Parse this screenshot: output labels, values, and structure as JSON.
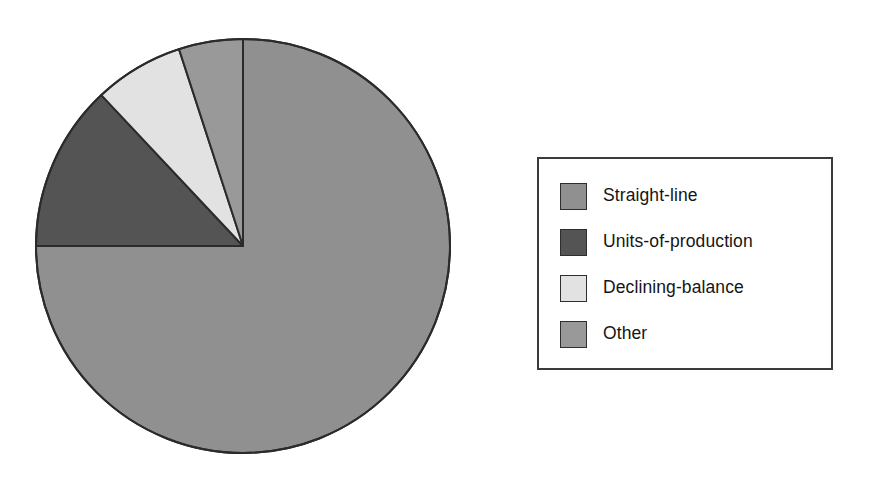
{
  "chart_data": {
    "type": "pie",
    "title": "",
    "subtitle": "",
    "xlabel": "",
    "ylabel": "",
    "grid": false,
    "legend_position": "right",
    "categories": [
      "Straight-line",
      "Units-of-production",
      "Declining-balance",
      "Other"
    ],
    "values": [
      75,
      13,
      7,
      5
    ],
    "unit": "%",
    "slice_order": "clockwise-from-top",
    "slices": [
      {
        "label": "Straight-line",
        "value": 75,
        "color": "#909090",
        "start_angle_deg": 0,
        "end_angle_deg": 270
      },
      {
        "label": "Units-of-production",
        "value": 13,
        "color": "#545454",
        "start_angle_deg": 270,
        "end_angle_deg": 316.8
      },
      {
        "label": "Declining-balance",
        "value": 7,
        "color": "#e2e2e2",
        "start_angle_deg": 316.8,
        "end_angle_deg": 342
      },
      {
        "label": "Other",
        "value": 5,
        "color": "#999999",
        "start_angle_deg": 342,
        "end_angle_deg": 360
      }
    ],
    "geometry": {
      "center_x": 243,
      "center_y": 246,
      "radius": 207
    },
    "style": {
      "outline_color": "#2b2b2b",
      "outline_width": 2,
      "background": "#ffffff"
    }
  },
  "legend": {
    "border_color": "#3b3b3b",
    "background": "#ffffff",
    "items": [
      {
        "label": "Straight-line",
        "color": "#909090"
      },
      {
        "label": "Units-of-production",
        "color": "#545454"
      },
      {
        "label": "Declining-balance",
        "color": "#e2e2e2"
      },
      {
        "label": "Other",
        "color": "#999999"
      }
    ]
  }
}
